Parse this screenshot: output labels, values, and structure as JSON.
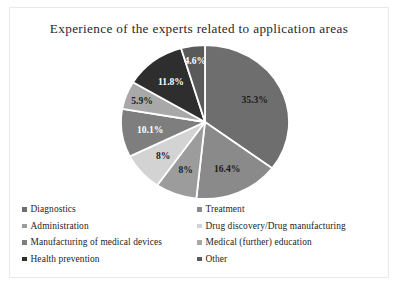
{
  "chart_data": {
    "type": "pie",
    "title": "Experience of the experts related to application areas",
    "xlabel": "",
    "ylabel": "",
    "legend_position": "bottom",
    "grid": false,
    "start_angle_deg": 0,
    "direction": "clockwise",
    "categories": [
      "Diagnostics",
      "Treatment",
      "Administration",
      "Drug discovery/Drug manufacturing",
      "Manufacturing of medical devices",
      "Medical (further) education",
      "Health prevention",
      "Other"
    ],
    "values": [
      35.3,
      16.4,
      8,
      8,
      10.1,
      5.9,
      11.8,
      4.6
    ],
    "labels": [
      "35.3%",
      "16.4%",
      "8%",
      "8%",
      "10.1%",
      "5.9%",
      "11.8%",
      "4.6%"
    ],
    "colors": [
      "#6e6e6e",
      "#8a8a8a",
      "#9c9c9c",
      "#d3d3d3",
      "#7e7e7e",
      "#a8a8a8",
      "#2e2e2e",
      "#5a5a5a"
    ],
    "label_colors": [
      "#1c1c1c",
      "#1c1c1c",
      "#1c1c1c",
      "#1c1c1c",
      "#ffffff",
      "#1c1c1c",
      "#ffffff",
      "#ffffff"
    ],
    "slice_separator_color": "#ffffff",
    "units": "percent"
  },
  "legend": {
    "left_column": [
      {
        "label": "Diagnostics",
        "color": "#6e6e6e"
      },
      {
        "label": "Administration",
        "color": "#9c9c9c"
      },
      {
        "label": "Manufacturing of medical devices",
        "color": "#7e7e7e"
      },
      {
        "label": "Health prevention",
        "color": "#2e2e2e"
      }
    ],
    "right_column": [
      {
        "label": "Treatment",
        "color": "#8a8a8a"
      },
      {
        "label": "Drug discovery/Drug manufacturing",
        "color": "#d3d3d3"
      },
      {
        "label": "Medical (further) education",
        "color": "#a8a8a8"
      },
      {
        "label": "Other",
        "color": "#5a5a5a"
      }
    ]
  }
}
